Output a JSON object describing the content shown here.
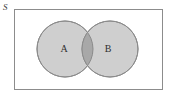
{
  "figure": {
    "type": "venn-diagram",
    "title": "",
    "universe": {
      "label": "S",
      "style": "italic",
      "rect": {
        "x": 14,
        "y": 9,
        "width": 149,
        "height": 81
      },
      "fill": "#ffffff",
      "stroke": "#8c8c8c"
    },
    "sets": [
      {
        "name": "set-a",
        "label": "A",
        "cx": 65,
        "cy": 49,
        "r": 28,
        "fill": "#cfcfcf",
        "stroke": "#8a8a8a",
        "label_x": 64,
        "label_y": 52
      },
      {
        "name": "set-b",
        "label": "B",
        "cx": 110,
        "cy": 49,
        "r": 28,
        "fill": "#cfcfcf",
        "stroke": "#8a8a8a",
        "label_x": 108,
        "label_y": 52
      }
    ],
    "intersection": {
      "name": "a-intersect-b",
      "label": "",
      "fill": "#a8a8a8",
      "stroke": "#8a8a8a"
    },
    "colors": {
      "circle_fill": "#cfcfcf",
      "intersection_fill": "#a8a8a8",
      "outline": "#8a8a8a",
      "box_outline": "#8c8c8c",
      "text": "#2f2f2f",
      "background": "#ffffff"
    }
  }
}
